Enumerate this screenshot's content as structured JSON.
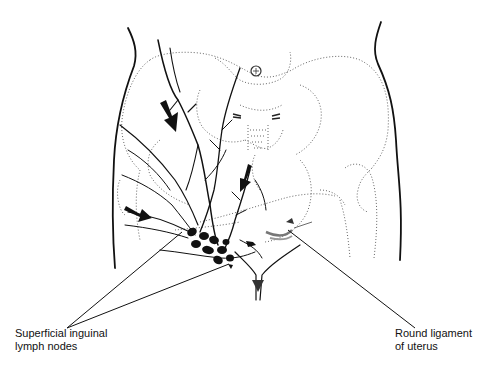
{
  "figure": {
    "labels": {
      "superficial_inguinal": {
        "line1": "Superficial inguinal",
        "line2": "lymph nodes"
      },
      "round_ligament": {
        "line1": "Round ligament",
        "line2": "of uterus"
      }
    },
    "colors": {
      "ink": "#111111",
      "dotted_outline": "#555555",
      "background": "#ffffff"
    }
  }
}
